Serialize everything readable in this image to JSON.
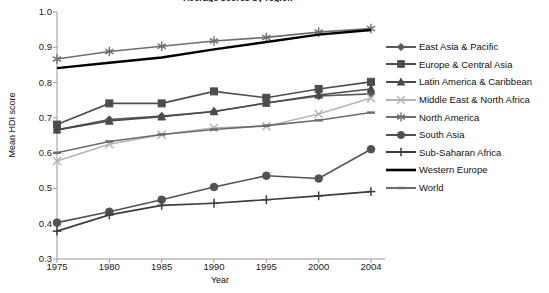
{
  "chart_data": {
    "type": "line",
    "title": "Average scores by region",
    "xlabel": "Year",
    "ylabel": "Mean HDI score",
    "x": [
      1975,
      1980,
      1985,
      1990,
      1995,
      2000,
      2004
    ],
    "xtick_labels": [
      "1975",
      "1980",
      "1985",
      "1990",
      "1995",
      "2000",
      "2004"
    ],
    "ytick_labels": [
      "1.0",
      "0.9",
      "0.8",
      "0.7",
      "0.6",
      "0.5",
      "0.4",
      "0.3"
    ],
    "ylim": [
      0.3,
      1.0
    ],
    "grid": false,
    "legend_position": "right",
    "series": [
      {
        "name": "East Asia & Pacific",
        "marker": "diamond",
        "color": "#595959",
        "values": [
          0.666,
          0.695,
          0.705,
          0.718,
          0.742,
          0.762,
          0.768
        ]
      },
      {
        "name": "Europe & Central Asia",
        "marker": "square",
        "color": "#4d4d4d",
        "values": [
          0.681,
          0.741,
          0.741,
          0.775,
          0.757,
          0.782,
          0.802
        ]
      },
      {
        "name": "Latin America & Caribbean",
        "marker": "triangle",
        "color": "#4a4a4a",
        "values": [
          0.666,
          0.691,
          0.703,
          0.718,
          0.742,
          0.765,
          0.782
        ]
      },
      {
        "name": "Middle East & North Africa",
        "marker": "x",
        "color": "#b5b5b5",
        "values": [
          0.578,
          0.625,
          0.652,
          0.672,
          0.676,
          0.711,
          0.756
        ]
      },
      {
        "name": "North America",
        "marker": "asterisk",
        "color": "#6e6e6e",
        "values": [
          0.867,
          0.888,
          0.903,
          0.918,
          0.928,
          0.943,
          0.953
        ]
      },
      {
        "name": "South Asia",
        "marker": "circle",
        "color": "#525252",
        "values": [
          0.403,
          0.434,
          0.468,
          0.504,
          0.536,
          0.528,
          0.611
        ]
      },
      {
        "name": "Sub-Saharan Africa",
        "marker": "plus",
        "color": "#3d3d3d",
        "values": [
          0.379,
          0.425,
          0.452,
          0.458,
          0.468,
          0.479,
          0.491
        ]
      },
      {
        "name": "Western Europe",
        "marker": "none",
        "color": "#000000",
        "values": [
          0.841,
          0.856,
          0.871,
          0.894,
          0.915,
          0.936,
          0.949
        ]
      },
      {
        "name": "World",
        "marker": "dash",
        "color": "#6b6b6b",
        "values": [
          0.601,
          0.633,
          0.653,
          0.667,
          0.678,
          0.693,
          0.715
        ]
      }
    ]
  }
}
